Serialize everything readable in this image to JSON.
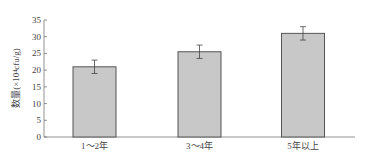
{
  "chart_data": {
    "type": "bar",
    "title": "",
    "xlabel": "",
    "ylabel": "数量(×10⁴cfu/g)",
    "categories": [
      "1～2年",
      "3～4年",
      "5年以上"
    ],
    "values": [
      21,
      25.5,
      31
    ],
    "error": [
      2,
      2,
      2
    ],
    "ylim": [
      0,
      35
    ],
    "yticks": [
      0,
      5,
      10,
      15,
      20,
      25,
      30,
      35
    ],
    "grid": false,
    "legend": null,
    "bar_color": "#c8c8c8",
    "bar_edge_color": "#555555"
  }
}
